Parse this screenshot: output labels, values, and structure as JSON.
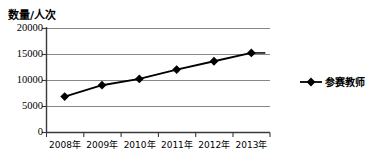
{
  "chart_data": {
    "type": "line",
    "title": "",
    "ylabel": "数量/人次",
    "xlabel": "",
    "categories": [
      "2008年",
      "2009年",
      "2010年",
      "2011年",
      "2012年",
      "2013年"
    ],
    "series": [
      {
        "name": "参赛教师",
        "values": [
          6900,
          9100,
          10300,
          12100,
          13700,
          15300
        ],
        "marker": "diamond",
        "color": "#000000"
      }
    ],
    "ylim": [
      0,
      20000
    ],
    "yticks": [
      0,
      5000,
      10000,
      15000,
      20000
    ],
    "ytick_labels": [
      "0",
      "5000",
      "10000",
      "15000",
      "20000"
    ],
    "grid": true,
    "grid_axis": "y",
    "legend_position": "right"
  },
  "legend": {
    "entries": [
      {
        "label": "参赛教师",
        "marker": "diamond-marker",
        "color": "#000000"
      }
    ]
  }
}
